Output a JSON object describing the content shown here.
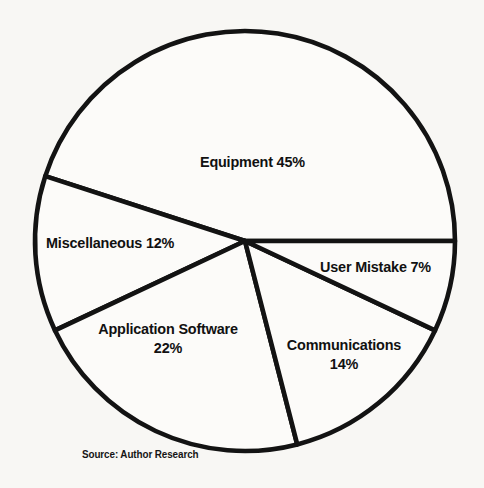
{
  "figure": {
    "background_color": "#f8f7f4",
    "source_note": "Source: Author Research"
  },
  "chart_data": {
    "type": "pie",
    "title": "",
    "subtitle": "",
    "xlabel": "",
    "ylabel": "",
    "grid": false,
    "legend_position": "none",
    "labels_inside_slices": true,
    "total_percent": 100,
    "stroke_color": "#131313",
    "slice_fill_color": "#fcfbf9",
    "geometry": {
      "center_x": 245,
      "center_y": 241,
      "radius": 210,
      "start_angle_deg": 0,
      "direction": "counterclockwise"
    },
    "categories": [
      "Equipment",
      "Miscellaneous",
      "Application Software",
      "Communications",
      "User Mistake"
    ],
    "values": [
      45,
      12,
      22,
      14,
      7
    ],
    "slices": [
      {
        "name": "Equipment",
        "value": 45,
        "value_label": "45%",
        "label_text": "Equipment 45%",
        "start_angle_deg": 0,
        "end_angle_deg": 162
      },
      {
        "name": "Miscellaneous",
        "value": 12,
        "value_label": "12%",
        "label_text": "Miscellaneous 12%",
        "start_angle_deg": 162,
        "end_angle_deg": 205.2
      },
      {
        "name": "Application Software",
        "value": 22,
        "value_label": "22%",
        "label_text": "Application Software\n22%",
        "start_angle_deg": 205.2,
        "end_angle_deg": 284.4
      },
      {
        "name": "Communications",
        "value": 14,
        "value_label": "14%",
        "label_text": "Communications\n14%",
        "start_angle_deg": 284.4,
        "end_angle_deg": 334.8
      },
      {
        "name": "User Mistake",
        "value": 7,
        "value_label": "7%",
        "label_text": "User Mistake 7%",
        "start_angle_deg": 334.8,
        "end_angle_deg": 360
      }
    ]
  }
}
